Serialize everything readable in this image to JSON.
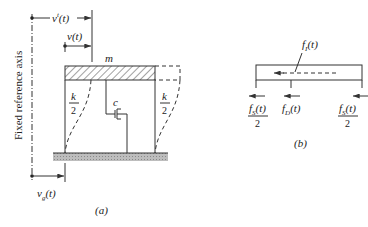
{
  "figure_a": {
    "axis_label": "Fixed reference axis",
    "total_disp": {
      "v": "v",
      "sup": "t",
      "arg": "(t)"
    },
    "rel_disp": {
      "v": "v",
      "arg": "(t)"
    },
    "ground_disp": {
      "v": "v",
      "sub": "g",
      "arg": "(t)"
    },
    "mass": "m",
    "stiffness_num": "k",
    "stiffness_den": "2",
    "damper": "c",
    "caption": "(a)"
  },
  "figure_b": {
    "inertia": {
      "f": "f",
      "sub": "I",
      "arg": "(t)"
    },
    "spring_left": {
      "f": "f",
      "sub": "S",
      "arg": "(t)",
      "den": "2"
    },
    "damping": {
      "f": "f",
      "sub": "D",
      "arg": "(t)"
    },
    "spring_right": {
      "f": "f",
      "sub": "S",
      "arg": "(t)",
      "den": "2"
    },
    "caption": "(b)"
  }
}
